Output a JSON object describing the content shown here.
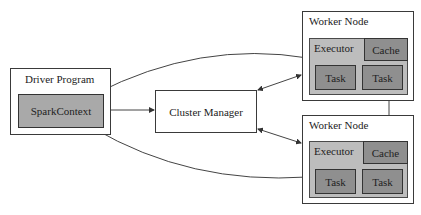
{
  "diagram": {
    "driver": {
      "title": "Driver Program",
      "context": "SparkContext"
    },
    "cluster_manager": {
      "label": "Cluster Manager"
    },
    "workers": [
      {
        "title": "Worker Node",
        "executor": "Executor",
        "cache": "Cache",
        "tasks": [
          "Task",
          "Task"
        ]
      },
      {
        "title": "Worker Node",
        "executor": "Executor",
        "cache": "Cache",
        "tasks": [
          "Task",
          "Task"
        ]
      }
    ],
    "colors": {
      "border": "#3a3a3a",
      "executor_fill": "#bdbdbd",
      "task_fill": "#8f8f8f",
      "context_fill": "#a9a9a9"
    }
  }
}
